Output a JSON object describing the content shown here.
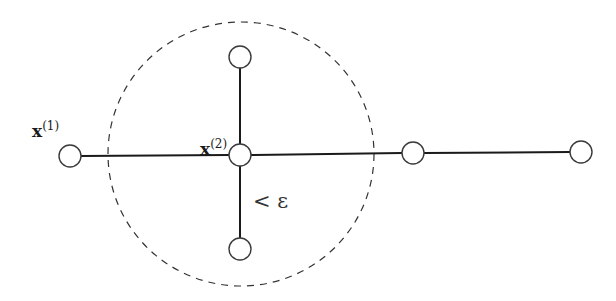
{
  "diagram": {
    "type": "graph-neighborhood",
    "nodes": [
      {
        "id": "x1",
        "label_main": "x",
        "label_sup": "(1)",
        "cx": 70,
        "cy": 156
      },
      {
        "id": "x2",
        "label_main": "x",
        "label_sup": "(2)",
        "cx": 240,
        "cy": 155
      },
      {
        "id": "top",
        "cx": 240,
        "cy": 57
      },
      {
        "id": "bottom",
        "cx": 240,
        "cy": 249
      },
      {
        "id": "right1",
        "cx": 413,
        "cy": 153
      },
      {
        "id": "right2",
        "cx": 581,
        "cy": 152
      }
    ],
    "edges": [
      {
        "from": "x1",
        "to": "x2"
      },
      {
        "from": "x2",
        "to": "top"
      },
      {
        "from": "x2",
        "to": "bottom"
      },
      {
        "from": "x2",
        "to": "right1"
      },
      {
        "from": "right1",
        "to": "right2"
      }
    ],
    "neighborhood": {
      "center": "x2",
      "cx": 241,
      "cy": 154,
      "rx": 133,
      "ry": 132,
      "style": "dashed"
    },
    "annotation": {
      "text": "< ε"
    },
    "labels": {
      "x1_main": "x",
      "x1_sup": "(1)",
      "x2_main": "x",
      "x2_sup": "(2)",
      "epsilon": "< ε"
    }
  }
}
